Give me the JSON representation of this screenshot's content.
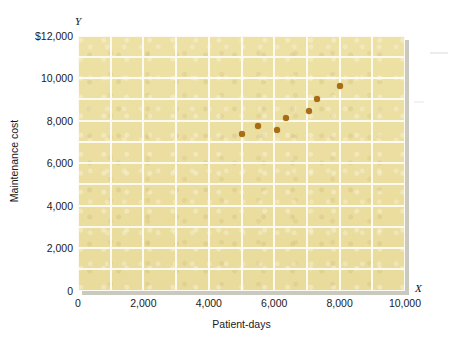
{
  "chart_data": {
    "type": "scatter",
    "title": "",
    "xlabel": "Patient-days",
    "ylabel": "Maintenance cost",
    "x_axis_symbol": "X",
    "y_axis_symbol": "Y",
    "xlim": [
      0,
      10000
    ],
    "ylim": [
      0,
      12000
    ],
    "grid": true,
    "grid_x_step": 1000,
    "grid_y_step": 1000,
    "legend": "none",
    "xticks": [
      "0",
      "2,000",
      "4,000",
      "6,000",
      "8,000",
      "10,000"
    ],
    "xtick_values": [
      0,
      2000,
      4000,
      6000,
      8000,
      10000
    ],
    "yticks": [
      "0",
      "2,000",
      "4,000",
      "6,000",
      "8,000",
      "10,000",
      "$12,000"
    ],
    "ytick_values": [
      0,
      2000,
      4000,
      6000,
      8000,
      10000,
      12000
    ],
    "series": [
      {
        "name": "Maintenance cost vs patient-days",
        "marker": "circle",
        "color": "#a96c12",
        "points": [
          {
            "x": 5000,
            "y": 7370
          },
          {
            "x": 5500,
            "y": 7750
          },
          {
            "x": 6080,
            "y": 7540
          },
          {
            "x": 6350,
            "y": 8100
          },
          {
            "x": 7070,
            "y": 8460
          },
          {
            "x": 7300,
            "y": 9020
          },
          {
            "x": 8000,
            "y": 9630
          }
        ]
      }
    ],
    "plot_background_color": "#ecdf9f",
    "gridline_color": "#fdfbf1"
  }
}
